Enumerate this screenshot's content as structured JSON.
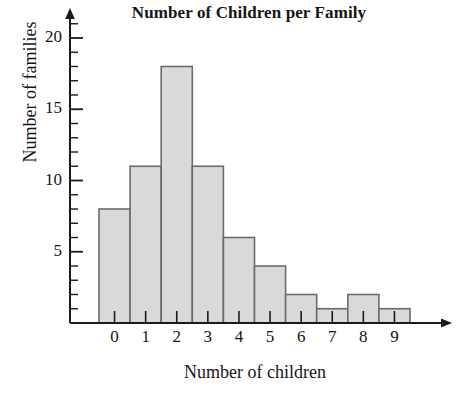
{
  "chart_data": {
    "type": "bar",
    "title": "Number of Children per Family",
    "xlabel": "Number of children",
    "ylabel": "Number of families",
    "categories": [
      "0",
      "1",
      "2",
      "3",
      "4",
      "5",
      "6",
      "7",
      "8",
      "9"
    ],
    "values": [
      8,
      11,
      18,
      11,
      6,
      4,
      2,
      1,
      2,
      1
    ],
    "x_tick_labels": [
      "0",
      "1",
      "2",
      "3",
      "4",
      "5",
      "6",
      "7",
      "8",
      "9"
    ],
    "y_tick_labels": [
      "5",
      "10",
      "15",
      "20"
    ],
    "y_tick_values": [
      5,
      10,
      15,
      20
    ],
    "y_minor_tick_step": 1,
    "ylim": [
      0,
      21
    ],
    "xlim": [
      0,
      10
    ],
    "grid": false,
    "legend": null,
    "bar_fill_color": "#d9d9d9",
    "bar_border_color": "#6b6b6b",
    "axis_color": "#1a1a1a",
    "style": "histogram-contiguous-bars-with-arrow-axes"
  }
}
